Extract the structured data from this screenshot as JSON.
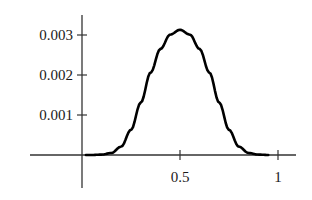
{
  "chart_data": {
    "type": "line",
    "title": "",
    "xlabel": "",
    "ylabel": "",
    "xlim": [
      -0.5,
      1.15
    ],
    "ylim": [
      -0.0008,
      0.0035
    ],
    "grid": false,
    "legend": null,
    "x_ticks": [
      {
        "value": 0.5,
        "label": "0.5"
      },
      {
        "value": 1,
        "label": "1"
      }
    ],
    "y_ticks": [
      {
        "value": 0.001,
        "label": "0.001"
      },
      {
        "value": 0.002,
        "label": "0.002"
      },
      {
        "value": 0.003,
        "label": "0.003"
      }
    ],
    "series": [
      {
        "name": "f(x)",
        "x": [
          0,
          0.05,
          0.1,
          0.15,
          0.2,
          0.25,
          0.3,
          0.35,
          0.4,
          0.45,
          0.5,
          0.55,
          0.6,
          0.65,
          0.7,
          0.75,
          0.8,
          0.85,
          0.9,
          0.95,
          1
        ],
        "values": [
          0,
          0.0,
          1e-05,
          5e-05,
          0.00021,
          0.00063,
          0.00131,
          0.00206,
          0.00265,
          0.00301,
          0.00313,
          0.00301,
          0.00265,
          0.00206,
          0.00131,
          0.00063,
          0.00021,
          5e-05,
          1e-05,
          0.0,
          0
        ]
      }
    ],
    "peak": {
      "x": 0.5,
      "y": 0.0031
    }
  }
}
